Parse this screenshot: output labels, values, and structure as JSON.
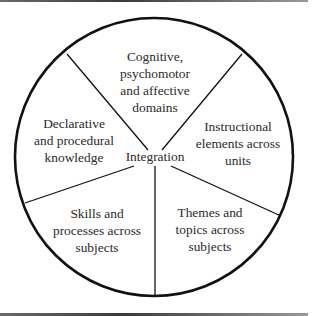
{
  "diagram": {
    "center_label": "Integration",
    "segments": [
      {
        "label": "Cognitive,\npsychomotor\nand affective\ndomains"
      },
      {
        "label": "Instructional\nelements across\nunits"
      },
      {
        "label": "Themes and\ntopics across\nsubjects"
      },
      {
        "label": "Skills and\nprocesses across\nsubjects"
      },
      {
        "label": "Declarative\nand procedural\nknowledge"
      }
    ],
    "colors": {
      "stroke": "#111111",
      "text": "#2a2a2a",
      "background": "#ffffff"
    }
  }
}
